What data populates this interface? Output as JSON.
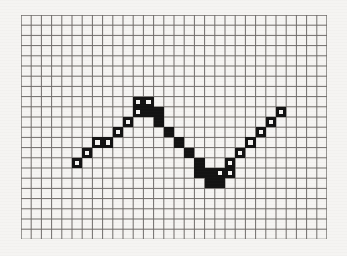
{
  "figure": {
    "kind": "grid-plot",
    "background_color": "#f5f4f2",
    "ink_color": "#131313",
    "grid_line_color": "#6e6b68"
  },
  "grid": {
    "origin_x": 21,
    "origin_y": 15,
    "cell_size": 10.2,
    "columns": 30,
    "rows": 22,
    "show_grid": true,
    "border": true
  },
  "chart_data": {
    "type": "line",
    "title": "",
    "subtitle": "",
    "xlabel": "",
    "ylabel": "",
    "xlim": [
      0,
      30
    ],
    "ylim": [
      0,
      22
    ],
    "grid": true,
    "legend": null,
    "legend_position": "none",
    "tick_labels_x": [],
    "tick_labels_y": [],
    "annotations": [],
    "series": [
      {
        "name": "staircase-wave",
        "marker": "square",
        "comment": "Each point is one grid cell. style hollow = outlined square (rising segment), filled = solid black square (falling segment). col/row are 0-based grid indices.",
        "points": [
          {
            "col": 5,
            "row": 14,
            "style": "hollow"
          },
          {
            "col": 6,
            "row": 13,
            "style": "hollow"
          },
          {
            "col": 7,
            "row": 12,
            "style": "hollow"
          },
          {
            "col": 8,
            "row": 12,
            "style": "hollow"
          },
          {
            "col": 9,
            "row": 11,
            "style": "hollow"
          },
          {
            "col": 10,
            "row": 10,
            "style": "hollow"
          },
          {
            "col": 11,
            "row": 9,
            "style": "hollow"
          },
          {
            "col": 11,
            "row": 8,
            "style": "hollow"
          },
          {
            "col": 12,
            "row": 8,
            "style": "hollow"
          },
          {
            "col": 12,
            "row": 9,
            "style": "filled"
          },
          {
            "col": 13,
            "row": 9,
            "style": "filled"
          },
          {
            "col": 13,
            "row": 10,
            "style": "filled"
          },
          {
            "col": 14,
            "row": 11,
            "style": "filled"
          },
          {
            "col": 15,
            "row": 12,
            "style": "filled"
          },
          {
            "col": 16,
            "row": 13,
            "style": "filled"
          },
          {
            "col": 17,
            "row": 14,
            "style": "filled"
          },
          {
            "col": 17,
            "row": 15,
            "style": "filled"
          },
          {
            "col": 18,
            "row": 15,
            "style": "filled"
          },
          {
            "col": 18,
            "row": 16,
            "style": "filled"
          },
          {
            "col": 19,
            "row": 16,
            "style": "filled"
          },
          {
            "col": 19,
            "row": 15,
            "style": "hollow"
          },
          {
            "col": 20,
            "row": 15,
            "style": "hollow"
          },
          {
            "col": 20,
            "row": 14,
            "style": "hollow"
          },
          {
            "col": 21,
            "row": 13,
            "style": "hollow"
          },
          {
            "col": 22,
            "row": 12,
            "style": "hollow"
          },
          {
            "col": 23,
            "row": 11,
            "style": "hollow"
          },
          {
            "col": 24,
            "row": 10,
            "style": "hollow"
          },
          {
            "col": 25,
            "row": 9,
            "style": "hollow"
          }
        ]
      }
    ]
  }
}
